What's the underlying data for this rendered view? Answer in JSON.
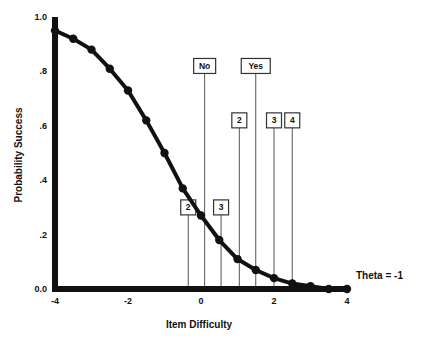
{
  "chart_data": {
    "type": "line",
    "title": "",
    "xlabel": "Item Difficulty",
    "ylabel": "Probability Success",
    "xlim": [
      -4,
      4
    ],
    "ylim": [
      0.0,
      1.0
    ],
    "grid": false,
    "x_ticks": [
      {
        "value": -4,
        "label": "-4"
      },
      {
        "value": -2,
        "label": "-2"
      },
      {
        "value": 0,
        "label": "0"
      },
      {
        "value": 2,
        "label": "2"
      },
      {
        "value": 4,
        "label": "4"
      }
    ],
    "y_ticks": [
      {
        "value": 1.0,
        "label": "1.0"
      },
      {
        "value": 0.8,
        "label": ".8"
      },
      {
        "value": 0.6,
        "label": ".6"
      },
      {
        "value": 0.4,
        "label": ".4"
      },
      {
        "value": 0.2,
        "label": ".2"
      },
      {
        "value": 0.0,
        "label": "0.0"
      }
    ],
    "series": [
      {
        "name": "Theta = -1",
        "x": [
          -4.0,
          -3.5,
          -3.0,
          -2.5,
          -2.0,
          -1.5,
          -1.0,
          -0.5,
          0.0,
          0.5,
          1.0,
          1.5,
          2.0,
          2.5,
          3.0,
          3.5,
          4.0
        ],
        "values": [
          0.95,
          0.92,
          0.88,
          0.81,
          0.73,
          0.62,
          0.5,
          0.37,
          0.27,
          0.18,
          0.11,
          0.07,
          0.04,
          0.02,
          0.01,
          0.0,
          0.0
        ]
      }
    ],
    "annotations": [
      {
        "label": "No",
        "x": 0.1,
        "label_y": 0.82
      },
      {
        "label": "Yes",
        "x": 1.5,
        "label_y": 0.82
      },
      {
        "label": "2",
        "x": 1.05,
        "label_y": 0.62
      },
      {
        "label": "3",
        "x": 2.0,
        "label_y": 0.62
      },
      {
        "label": "4",
        "x": 2.5,
        "label_y": 0.62
      },
      {
        "label": "2",
        "x": -0.35,
        "label_y": 0.3
      },
      {
        "label": "3",
        "x": 0.55,
        "label_y": 0.3
      }
    ],
    "series_label": "Theta = -1"
  }
}
